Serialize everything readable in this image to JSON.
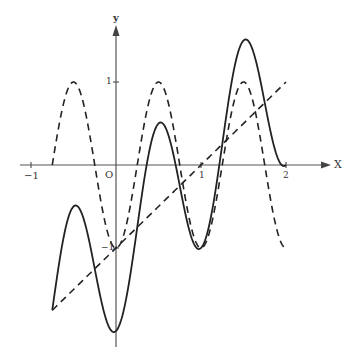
{
  "chart_data": {
    "type": "line",
    "title": "",
    "xlabel": "X",
    "ylabel": "y",
    "x_ticks": [
      "-1",
      "0",
      "1",
      "2"
    ],
    "y_ticks": [
      "1",
      "-1"
    ],
    "origin_label": "O",
    "xlim": [
      -1.1,
      2.5
    ],
    "ylim": [
      -2.2,
      1.7
    ],
    "grid": false,
    "legend": null,
    "series": [
      {
        "name": "linear",
        "style": "dashed",
        "formula": "y = x - 1",
        "x_range": [
          -0.75,
          2.0
        ],
        "points": [
          [
            -0.75,
            -1.75
          ],
          [
            0,
            -1
          ],
          [
            1,
            0
          ],
          [
            2,
            1
          ]
        ]
      },
      {
        "name": "cosine",
        "style": "dashed",
        "formula": "y = -cos(2πx)",
        "x_range": [
          -0.75,
          2.0
        ],
        "points": [
          [
            -0.75,
            0
          ],
          [
            -0.5,
            1
          ],
          [
            0,
            -1
          ],
          [
            0.5,
            1
          ],
          [
            1,
            -1
          ],
          [
            1.5,
            1
          ],
          [
            2,
            -1
          ]
        ]
      },
      {
        "name": "sum",
        "style": "solid",
        "formula": "y = (x - 1) - cos(2πx)",
        "x_range": [
          -0.75,
          2.0
        ],
        "points": [
          [
            -0.75,
            -1.75
          ],
          [
            -0.5,
            -0.5
          ],
          [
            0,
            -2
          ],
          [
            0.5,
            0.5
          ],
          [
            1,
            -1
          ],
          [
            1.5,
            1.5
          ],
          [
            2,
            0
          ]
        ]
      }
    ]
  },
  "labels": {
    "x_axis": "X",
    "y_axis": "y",
    "origin": "O",
    "tick_x_neg1": "−1",
    "tick_x_1": "1",
    "tick_x_2": "2",
    "tick_y_1": "1",
    "tick_y_neg1": "−1"
  }
}
